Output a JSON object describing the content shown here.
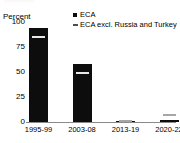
{
  "chart_data": {
    "type": "bar",
    "title": "",
    "xlabel": "",
    "ylabel": "Percent",
    "ylim": [
      0,
      100
    ],
    "yticks": [
      "0",
      "25",
      "50",
      "75",
      "100"
    ],
    "grid": false,
    "legend_position": "top-right",
    "categories": [
      "1995-99",
      "2003-08",
      "2013-19",
      "2020-22"
    ],
    "series": [
      {
        "name": "ECA",
        "type": "bar",
        "color": "#0d0d0d",
        "marker": "square",
        "values": [
          94,
          58,
          0.3,
          2.5
        ]
      },
      {
        "name": "ECA excl. Russia and Turkey",
        "type": "marker",
        "color": "#a6a6a6",
        "marker": "dash",
        "values": [
          85,
          49,
          1,
          7
        ]
      }
    ]
  },
  "axis": {
    "y_title": "Percent",
    "y_ticks": [
      {
        "label": "100",
        "value": 100
      },
      {
        "label": "75",
        "value": 75
      },
      {
        "label": "50",
        "value": 50
      },
      {
        "label": "25",
        "value": 25
      },
      {
        "label": "0",
        "value": 0
      }
    ],
    "x_ticks": [
      {
        "label": "1995-99"
      },
      {
        "label": "2003-08"
      },
      {
        "label": "2013-19"
      },
      {
        "label": "2020-22"
      }
    ]
  },
  "legend": {
    "items": [
      {
        "label": "ECA",
        "marker": "square",
        "color": "#0d0d0d"
      },
      {
        "label": "ECA excl. Russia and Turkey",
        "marker": "dash",
        "color": "#4d4d4d"
      }
    ]
  }
}
